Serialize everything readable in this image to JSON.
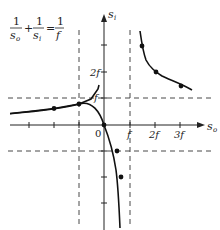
{
  "formula": {
    "term1_num": "1",
    "term1_den": "s",
    "term1_sub": "o",
    "plus": "+",
    "term2_num": "1",
    "term2_den": "s",
    "term2_sub": "i",
    "equals": "=",
    "term3_num": "1",
    "term3_den": "f"
  },
  "axes": {
    "x_label": "s",
    "x_sub": "o",
    "y_label": "s",
    "y_sub": "i",
    "origin_label": "0",
    "x_ticks": [
      "f",
      "2f",
      "3f"
    ],
    "y_ticks": [
      "f",
      "2f"
    ]
  },
  "asymptotes": {
    "horizontal": [
      "s_i = f",
      "s_i = -f"
    ],
    "vertical": [
      "s_o = f",
      "s_o = -f"
    ]
  },
  "curve": {
    "equation": "1/s_o + 1/s_i = 1/f",
    "marked_points_so_over_f": [
      -2,
      -1,
      0,
      0.5,
      0.67,
      1.2,
      1.5,
      2,
      3
    ]
  }
}
